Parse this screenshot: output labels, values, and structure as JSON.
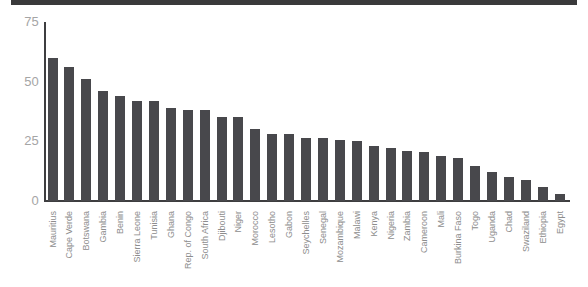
{
  "header": {
    "band_color": "#3a3a3b"
  },
  "chart_data": {
    "type": "bar",
    "categories": [
      "Mauritius",
      "Cape Verde",
      "Botswana",
      "Gambia",
      "Benin",
      "Sierra Leone",
      "Tunisia",
      "Ghana",
      "Rep. of Congo",
      "South Africa",
      "Djibouti",
      "Niger",
      "Morocco",
      "Lesotho",
      "Gabon",
      "Seychelles",
      "Senegal",
      "Mozambique",
      "Malawi",
      "Kenya",
      "Nigeria",
      "Zambia",
      "Cameroon",
      "Mali",
      "Burkina Faso",
      "Togo",
      "Uganda",
      "Chad",
      "Swaziland",
      "Ethiopia",
      "Egypt"
    ],
    "values": [
      60,
      56,
      51,
      46,
      44,
      42,
      42,
      39,
      38,
      38,
      35,
      35,
      30,
      28,
      28,
      26.5,
      26.5,
      25.5,
      25,
      23,
      22,
      21,
      20.5,
      19,
      18,
      14.5,
      12,
      10,
      9,
      6,
      3
    ],
    "title": "",
    "xlabel": "",
    "ylabel": "",
    "ylim": [
      0,
      75
    ],
    "yticks": [
      0,
      25,
      50,
      75
    ],
    "ytick_labels": [
      "0",
      "25",
      "50",
      "75"
    ],
    "grid": false,
    "legend": null,
    "bar_color": "#48484c",
    "axis_color": "#3e3e40",
    "ytick_label_color": "#a5a5a5",
    "xtick_label_color": "#8d8d8d"
  }
}
